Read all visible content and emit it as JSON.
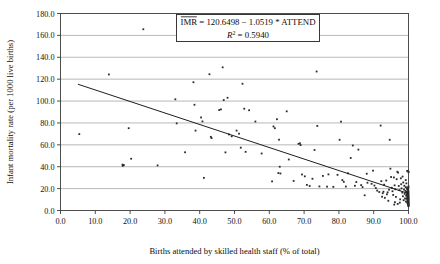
{
  "chart_data": {
    "type": "scatter",
    "title": "",
    "xlabel": "Births attended by skilled health staff (% of total)",
    "ylabel": "Infant mortality rate (per 1000 live births)",
    "xlim": [
      0.0,
      100.0
    ],
    "ylim": [
      0.0,
      180.0
    ],
    "xticks": [
      "0.0",
      "10.0",
      "20.0",
      "30.0",
      "40.0",
      "50.0",
      "60.0",
      "70.0",
      "80.0",
      "90.0",
      "100.0"
    ],
    "yticks": [
      "0.0",
      "20.0",
      "40.0",
      "60.0",
      "80.0",
      "100.0",
      "120.0",
      "140.0",
      "160.0",
      "180.0"
    ],
    "xtick_values": [
      0,
      10,
      20,
      30,
      40,
      50,
      60,
      70,
      80,
      90,
      100
    ],
    "ytick_values": [
      0,
      20,
      40,
      60,
      80,
      100,
      120,
      140,
      160,
      180
    ],
    "grid": "horizontal",
    "legend": "none",
    "annotation": {
      "line1_prefix": "IMR",
      "line1_rest": " = 120.6498 − 1.0519 * ATTEND",
      "line2_symbol": "R",
      "line2_exponent": "2",
      "line2_rest": " = 0.5940",
      "intercept": 120.6498,
      "slope": -1.0519,
      "r_squared": 0.594
    },
    "fit_line": {
      "type": "linear",
      "x_start": 5.0,
      "y_start": 115.39,
      "x_end": 100.0,
      "y_end": 15.46
    },
    "series": [
      {
        "name": "Countries",
        "marker": "dot",
        "color": "#2b2b2b",
        "points": [
          [
            5.4,
            69.8
          ],
          [
            13.9,
            124.3
          ],
          [
            17.8,
            41.9
          ],
          [
            17.9,
            40.8
          ],
          [
            18.2,
            41.5
          ],
          [
            19.6,
            75.2
          ],
          [
            20.3,
            47.3
          ],
          [
            23.8,
            165.6
          ],
          [
            27.9,
            41.2
          ],
          [
            33.0,
            101.6
          ],
          [
            33.4,
            79.6
          ],
          [
            35.8,
            53.2
          ],
          [
            38.2,
            117.2
          ],
          [
            38.5,
            96.6
          ],
          [
            38.8,
            73.0
          ],
          [
            40.4,
            85.0
          ],
          [
            40.8,
            81.4
          ],
          [
            41.2,
            29.8
          ],
          [
            42.8,
            124.5
          ],
          [
            43.2,
            67.3
          ],
          [
            43.4,
            66.2
          ],
          [
            45.6,
            91.8
          ],
          [
            46.1,
            92.4
          ],
          [
            46.6,
            130.8
          ],
          [
            46.9,
            100.9
          ],
          [
            47.4,
            53.1
          ],
          [
            48.0,
            103.0
          ],
          [
            48.4,
            69.5
          ],
          [
            49.2,
            67.8
          ],
          [
            50.6,
            73.0
          ],
          [
            51.3,
            70.2
          ],
          [
            51.8,
            57.4
          ],
          [
            52.3,
            115.8
          ],
          [
            52.8,
            93.0
          ],
          [
            53.2,
            53.6
          ],
          [
            54.2,
            91.6
          ],
          [
            56.0,
            81.3
          ],
          [
            57.8,
            52.1
          ],
          [
            60.8,
            26.6
          ],
          [
            61.2,
            76.8
          ],
          [
            61.6,
            75.2
          ],
          [
            62.2,
            83.4
          ],
          [
            62.6,
            34.2
          ],
          [
            62.8,
            64.7
          ],
          [
            63.0,
            40.0
          ],
          [
            63.2,
            33.8
          ],
          [
            65.0,
            90.6
          ],
          [
            65.6,
            46.6
          ],
          [
            67.0,
            27.0
          ],
          [
            68.4,
            60.9
          ],
          [
            68.8,
            61.4
          ],
          [
            69.0,
            59.8
          ],
          [
            69.4,
            32.9
          ],
          [
            70.2,
            31.2
          ],
          [
            70.8,
            23.4
          ],
          [
            71.6,
            22.4
          ],
          [
            72.4,
            29.0
          ],
          [
            73.0,
            55.3
          ],
          [
            73.6,
            127.0
          ],
          [
            73.8,
            77.3
          ],
          [
            74.4,
            22.0
          ],
          [
            75.4,
            31.6
          ],
          [
            76.6,
            21.8
          ],
          [
            77.0,
            33.0
          ],
          [
            78.4,
            21.6
          ],
          [
            79.6,
            32.6
          ],
          [
            80.2,
            64.6
          ],
          [
            80.6,
            81.2
          ],
          [
            81.4,
            26.2
          ],
          [
            82.0,
            21.9
          ],
          [
            83.4,
            48.0
          ],
          [
            84.0,
            59.4
          ],
          [
            85.0,
            26.0
          ],
          [
            85.6,
            55.6
          ],
          [
            86.4,
            23.2
          ],
          [
            87.4,
            13.9
          ],
          [
            88.0,
            33.6
          ],
          [
            88.2,
            25.4
          ],
          [
            89.4,
            24.4
          ],
          [
            90.2,
            22.8
          ],
          [
            90.6,
            20.5
          ],
          [
            91.0,
            18.2
          ],
          [
            91.6,
            16.9
          ],
          [
            92.0,
            77.6
          ],
          [
            92.2,
            26.8
          ],
          [
            92.4,
            12.6
          ],
          [
            92.6,
            15.8
          ],
          [
            92.8,
            17.2
          ],
          [
            93.0,
            23.6
          ],
          [
            93.2,
            11.6
          ],
          [
            93.6,
            27.4
          ],
          [
            93.8,
            14.8
          ],
          [
            94.0,
            16.6
          ],
          [
            94.2,
            8.9
          ],
          [
            94.6,
            64.6
          ],
          [
            94.8,
            38.2
          ],
          [
            95.0,
            30.6
          ],
          [
            95.2,
            20.8
          ],
          [
            95.4,
            17.6
          ],
          [
            95.6,
            14.2
          ],
          [
            95.8,
            30.2
          ],
          [
            96.0,
            23.0
          ],
          [
            96.2,
            19.4
          ],
          [
            96.4,
            12.4
          ],
          [
            96.6,
            28.6
          ],
          [
            96.8,
            35.4
          ],
          [
            97.0,
            34.6
          ],
          [
            97.2,
            22.4
          ],
          [
            97.4,
            18.6
          ],
          [
            97.6,
            10.2
          ],
          [
            97.8,
            29.4
          ],
          [
            98.0,
            20.2
          ],
          [
            98.2,
            16.4
          ],
          [
            98.4,
            13.0
          ],
          [
            98.5,
            25.6
          ],
          [
            98.6,
            9.4
          ],
          [
            98.7,
            19.2
          ],
          [
            98.8,
            22.6
          ],
          [
            98.9,
            15.2
          ],
          [
            99.0,
            11.0
          ],
          [
            99.1,
            18.0
          ],
          [
            99.2,
            21.4
          ],
          [
            99.25,
            8.2
          ],
          [
            99.3,
            13.6
          ],
          [
            99.35,
            17.0
          ],
          [
            99.4,
            24.8
          ],
          [
            99.45,
            10.6
          ],
          [
            99.5,
            14.6
          ],
          [
            99.55,
            19.8
          ],
          [
            99.6,
            7.4
          ],
          [
            99.62,
            12.0
          ],
          [
            99.65,
            16.2
          ],
          [
            99.68,
            21.0
          ],
          [
            99.7,
            9.0
          ],
          [
            99.72,
            13.2
          ],
          [
            99.74,
            17.8
          ],
          [
            99.76,
            6.4
          ],
          [
            99.78,
            11.4
          ],
          [
            99.8,
            15.0
          ],
          [
            99.82,
            19.0
          ],
          [
            99.84,
            8.6
          ],
          [
            99.86,
            12.8
          ],
          [
            99.88,
            5.8
          ],
          [
            99.9,
            10.0
          ],
          [
            99.91,
            14.4
          ],
          [
            99.92,
            18.4
          ],
          [
            99.93,
            7.0
          ],
          [
            99.94,
            11.8
          ],
          [
            99.95,
            16.0
          ],
          [
            99.96,
            4.8
          ],
          [
            99.97,
            9.6
          ],
          [
            99.975,
            13.8
          ],
          [
            99.98,
            6.2
          ],
          [
            99.985,
            20.6
          ],
          [
            99.99,
            8.0
          ],
          [
            99.992,
            12.2
          ],
          [
            99.994,
            5.2
          ],
          [
            99.996,
            15.6
          ],
          [
            99.997,
            10.4
          ],
          [
            99.998,
            3.9
          ],
          [
            99.999,
            7.8
          ],
          [
            100.0,
            11.2
          ],
          [
            100.0,
            4.4
          ],
          [
            100.0,
            17.4
          ],
          [
            100.0,
            6.8
          ],
          [
            100.0,
            13.4
          ],
          [
            100.0,
            9.2
          ],
          [
            100.0,
            22.0
          ],
          [
            100.0,
            35.6
          ],
          [
            100.0,
            5.6
          ],
          [
            99.99,
            35.0
          ],
          [
            99.6,
            36.2
          ],
          [
            99.2,
            27.8
          ],
          [
            98.3,
            31.0
          ],
          [
            97.9,
            24.0
          ],
          [
            96.9,
            6.0
          ],
          [
            96.1,
            7.6
          ],
          [
            95.9,
            5.4
          ],
          [
            97.5,
            7.2
          ],
          [
            94.4,
            19.0
          ],
          [
            89.8,
            36.4
          ],
          [
            86.8,
            21.4
          ],
          [
            84.6,
            22.6
          ],
          [
            82.6,
            34.0
          ],
          [
            81.0,
            27.8
          ]
        ]
      }
    ]
  }
}
